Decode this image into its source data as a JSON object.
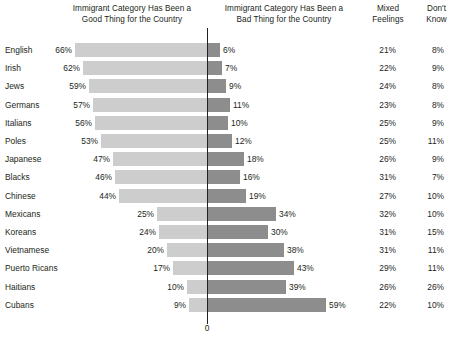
{
  "headers": {
    "good": {
      "line1": "Immigrant Category Has Been a",
      "line2": "Good Thing for the Country"
    },
    "bad": {
      "line1": "Immigrant Category Has Been a",
      "line2": "Bad Thing for the Country"
    },
    "mixed": {
      "line1": "Mixed",
      "line2": "Feelings"
    },
    "dont_know": {
      "line1": "Don't",
      "line2": "Know"
    }
  },
  "axis": {
    "zero_label": "0"
  },
  "colors": {
    "good_bar": "#cdcdcd",
    "bad_bar": "#8d8d8d",
    "text": "#231f20",
    "axis": "#231f20",
    "background": "#ffffff"
  },
  "chart_data": {
    "type": "bar",
    "title": "",
    "xlabel": "",
    "ylabel": "",
    "orientation": "horizontal",
    "layout": "diverging-bidirectional",
    "grid": false,
    "legend": "none",
    "axis_origin_label": "0",
    "scale_px_per_percent": 2.0,
    "categories": [
      "English",
      "Irish",
      "Jews",
      "Germans",
      "Italians",
      "Poles",
      "Japanese",
      "Blacks",
      "Chinese",
      "Mexicans",
      "Koreans",
      "Vietnamese",
      "Puerto Ricans",
      "Haitians",
      "Cubans"
    ],
    "series": [
      {
        "name": "Immigrant Category Has Been a Good Thing for the Country",
        "direction": "left",
        "color": "#cdcdcd",
        "values": [
          66,
          62,
          59,
          57,
          56,
          53,
          47,
          46,
          44,
          25,
          24,
          20,
          17,
          10,
          9
        ]
      },
      {
        "name": "Immigrant Category Has Been a Bad Thing for the Country",
        "direction": "right",
        "color": "#8d8d8d",
        "values": [
          6,
          7,
          9,
          11,
          10,
          12,
          18,
          16,
          19,
          34,
          30,
          38,
          43,
          39,
          59
        ]
      },
      {
        "name": "Mixed Feelings",
        "direction": "table",
        "values": [
          21,
          22,
          24,
          23,
          25,
          25,
          26,
          31,
          27,
          32,
          31,
          31,
          29,
          26,
          22
        ]
      },
      {
        "name": "Don't Know",
        "direction": "table",
        "values": [
          8,
          9,
          8,
          8,
          9,
          11,
          9,
          7,
          10,
          10,
          15,
          11,
          11,
          26,
          10
        ]
      }
    ]
  },
  "rows": [
    {
      "label": "English",
      "good": "66%",
      "bad": "6%",
      "mixed": "21%",
      "dk": "8%"
    },
    {
      "label": "Irish",
      "good": "62%",
      "bad": "7%",
      "mixed": "22%",
      "dk": "9%"
    },
    {
      "label": "Jews",
      "good": "59%",
      "bad": "9%",
      "mixed": "24%",
      "dk": "8%"
    },
    {
      "label": "Germans",
      "good": "57%",
      "bad": "11%",
      "mixed": "23%",
      "dk": "8%"
    },
    {
      "label": "Italians",
      "good": "56%",
      "bad": "10%",
      "mixed": "25%",
      "dk": "9%"
    },
    {
      "label": "Poles",
      "good": "53%",
      "bad": "12%",
      "mixed": "25%",
      "dk": "11%"
    },
    {
      "label": "Japanese",
      "good": "47%",
      "bad": "18%",
      "mixed": "26%",
      "dk": "9%"
    },
    {
      "label": "Blacks",
      "good": "46%",
      "bad": "16%",
      "mixed": "31%",
      "dk": "7%"
    },
    {
      "label": "Chinese",
      "good": "44%",
      "bad": "19%",
      "mixed": "27%",
      "dk": "10%"
    },
    {
      "label": "Mexicans",
      "good": "25%",
      "bad": "34%",
      "mixed": "32%",
      "dk": "10%"
    },
    {
      "label": "Koreans",
      "good": "24%",
      "bad": "30%",
      "mixed": "31%",
      "dk": "15%"
    },
    {
      "label": "Vietnamese",
      "good": "20%",
      "bad": "38%",
      "mixed": "31%",
      "dk": "11%"
    },
    {
      "label": "Puerto Ricans",
      "good": "17%",
      "bad": "43%",
      "mixed": "29%",
      "dk": "11%"
    },
    {
      "label": "Haitians",
      "good": "10%",
      "bad": "39%",
      "mixed": "26%",
      "dk": "26%"
    },
    {
      "label": "Cubans",
      "good": "9%",
      "bad": "59%",
      "mixed": "22%",
      "dk": "10%"
    }
  ]
}
